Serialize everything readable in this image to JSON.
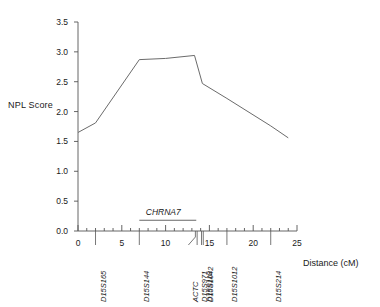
{
  "chart_data": {
    "type": "line",
    "title": "",
    "xlabel": "Distance (cM)",
    "ylabel": "NPL Score",
    "xlim": [
      0,
      25
    ],
    "ylim": [
      0.0,
      3.5
    ],
    "grid": false,
    "legend": "none",
    "x_ticks": [
      0,
      5,
      10,
      15,
      20,
      25
    ],
    "x_tick_labels": [
      "0",
      "5",
      "10",
      "15",
      "20",
      "25"
    ],
    "x_minor_tick_step": 1,
    "y_ticks": [
      0.0,
      0.5,
      1.0,
      1.5,
      2.0,
      2.5,
      3.0,
      3.5
    ],
    "y_tick_labels": [
      "0.0",
      "0.5",
      "1.0",
      "1.5",
      "2.0",
      "2.5",
      "3.0",
      "3.5"
    ],
    "series": [
      {
        "name": "NPL Score",
        "color": "#6b6b6b",
        "points": [
          {
            "x": 0.0,
            "y": 1.65
          },
          {
            "x": 2.0,
            "y": 1.81
          },
          {
            "x": 7.0,
            "y": 2.87
          },
          {
            "x": 10.0,
            "y": 2.89
          },
          {
            "x": 13.3,
            "y": 2.94
          },
          {
            "x": 14.2,
            "y": 2.47
          },
          {
            "x": 17.0,
            "y": 2.22
          },
          {
            "x": 22.0,
            "y": 1.76
          },
          {
            "x": 24.0,
            "y": 1.56
          }
        ]
      }
    ],
    "markers": [
      {
        "label": "D15S165",
        "x": 2.0,
        "tilted": false
      },
      {
        "label": "D15S144",
        "x": 7.0,
        "tilted": false
      },
      {
        "label": "ACTC",
        "x": 13.4,
        "tilted": true
      },
      {
        "label": "D15S971",
        "x": 13.6,
        "tilted": false
      },
      {
        "label": "D15S118",
        "x": 14.1,
        "tilted": false
      },
      {
        "label": "D15S1042",
        "x": 14.3,
        "tilted": false
      },
      {
        "label": "D15S1012",
        "x": 17.0,
        "tilted": false
      },
      {
        "label": "D15S214",
        "x": 22.0,
        "tilted": false
      }
    ],
    "annotations": [
      {
        "text": "CHRNA7",
        "x_start": 7.0,
        "x_end": 13.5,
        "y": 0.18
      }
    ]
  }
}
